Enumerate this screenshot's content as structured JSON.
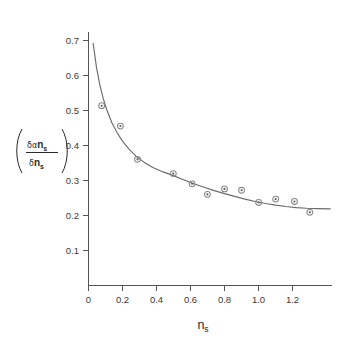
{
  "chart_data": {
    "type": "scatter",
    "title": "",
    "subtitle": "",
    "xlabel": "n_s",
    "xlabel_base": "n",
    "xlabel_sub": "s",
    "ylabel": "(δα n_s / δn_s)",
    "ylabel_numerator_greek": "δα",
    "ylabel_numerator_base": "n",
    "ylabel_numerator_sub": "s",
    "ylabel_denominator_greek": "δ",
    "ylabel_denominator_base": "n",
    "ylabel_denominator_sub": "s",
    "xlim": [
      0,
      1.43
    ],
    "ylim": [
      0,
      0.745
    ],
    "xticks": [
      0,
      0.2,
      0.4,
      0.6,
      0.8,
      1.0,
      1.2
    ],
    "xtick_labels": [
      "0",
      "0.2",
      "0.4",
      "0.6",
      "0.8",
      "1.0",
      "1.2"
    ],
    "yticks": [
      0.1,
      0.2,
      0.3,
      0.4,
      0.5,
      0.6,
      0.7
    ],
    "ytick_labels": [
      "0.1",
      "0.2",
      "0.3",
      "0.4",
      "0.5",
      "0.6",
      "0.7"
    ],
    "grid": false,
    "legend": null,
    "marker_style": "circle-with-center-dot",
    "marker_color": "#8a8a8a",
    "curve_color": "#6b6b6b",
    "axis_color": "#555555",
    "series": [
      {
        "name": "data",
        "kind": "scatter",
        "points": [
          {
            "x": 0.08,
            "y": 0.528
          },
          {
            "x": 0.19,
            "y": 0.468
          },
          {
            "x": 0.29,
            "y": 0.37
          },
          {
            "x": 0.5,
            "y": 0.328
          },
          {
            "x": 0.61,
            "y": 0.298
          },
          {
            "x": 0.7,
            "y": 0.267
          },
          {
            "x": 0.8,
            "y": 0.283
          },
          {
            "x": 0.9,
            "y": 0.279
          },
          {
            "x": 1.0,
            "y": 0.243
          },
          {
            "x": 1.1,
            "y": 0.253
          },
          {
            "x": 1.21,
            "y": 0.246
          },
          {
            "x": 1.3,
            "y": 0.214
          }
        ]
      },
      {
        "name": "fit",
        "kind": "line",
        "points": [
          {
            "x": 0.03,
            "y": 0.712
          },
          {
            "x": 0.05,
            "y": 0.64
          },
          {
            "x": 0.07,
            "y": 0.588
          },
          {
            "x": 0.09,
            "y": 0.548
          },
          {
            "x": 0.11,
            "y": 0.516
          },
          {
            "x": 0.14,
            "y": 0.478
          },
          {
            "x": 0.17,
            "y": 0.449
          },
          {
            "x": 0.2,
            "y": 0.425
          },
          {
            "x": 0.24,
            "y": 0.4
          },
          {
            "x": 0.28,
            "y": 0.38
          },
          {
            "x": 0.33,
            "y": 0.361
          },
          {
            "x": 0.38,
            "y": 0.346
          },
          {
            "x": 0.44,
            "y": 0.333
          },
          {
            "x": 0.5,
            "y": 0.322
          },
          {
            "x": 0.56,
            "y": 0.31
          },
          {
            "x": 0.62,
            "y": 0.298
          },
          {
            "x": 0.68,
            "y": 0.288
          },
          {
            "x": 0.74,
            "y": 0.278
          },
          {
            "x": 0.8,
            "y": 0.269
          },
          {
            "x": 0.86,
            "y": 0.261
          },
          {
            "x": 0.92,
            "y": 0.253
          },
          {
            "x": 0.98,
            "y": 0.246
          },
          {
            "x": 1.04,
            "y": 0.24
          },
          {
            "x": 1.1,
            "y": 0.235
          },
          {
            "x": 1.16,
            "y": 0.231
          },
          {
            "x": 1.22,
            "y": 0.228
          },
          {
            "x": 1.28,
            "y": 0.226
          },
          {
            "x": 1.34,
            "y": 0.225
          },
          {
            "x": 1.42,
            "y": 0.224
          }
        ]
      }
    ]
  },
  "layout": {
    "plot_left_px": 88,
    "plot_bottom_px": 285,
    "plot_right_px": 332,
    "plot_top_px": 32,
    "x_units_per_px": 0.005882,
    "y_units_per_px": 0.002857
  }
}
